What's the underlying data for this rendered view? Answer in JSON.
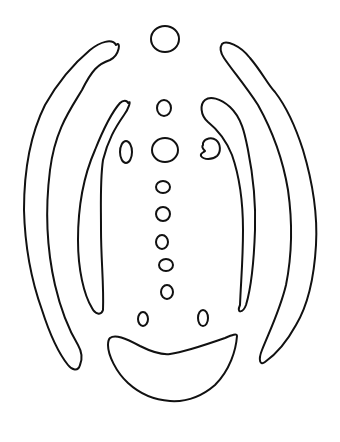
{
  "figure": {
    "type": "line-drawing",
    "background": "#ffffff",
    "stroke_color": "#111111",
    "shapes": {
      "top_circle": "circle",
      "center_column": [
        "oval",
        "oval-large",
        "oval",
        "oval",
        "oval",
        "oval",
        "oval"
      ],
      "side_ovals": [
        "left-oval",
        "right-notched-oval"
      ],
      "lower_ovals": [
        "left",
        "right"
      ],
      "bands": [
        "left-outer",
        "left-inner",
        "right-inner",
        "right-outer"
      ],
      "bottom": "crescent"
    }
  }
}
